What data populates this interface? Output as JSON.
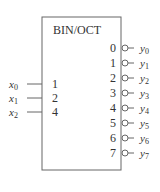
{
  "diagram": {
    "title": "BIN/OCT",
    "inputs": [
      {
        "var": "x",
        "sub": "0",
        "weight": "1"
      },
      {
        "var": "x",
        "sub": "1",
        "weight": "2"
      },
      {
        "var": "x",
        "sub": "2",
        "weight": "4"
      }
    ],
    "outputs": [
      {
        "index": "0",
        "var": "y",
        "sub": "0"
      },
      {
        "index": "1",
        "var": "y",
        "sub": "1"
      },
      {
        "index": "2",
        "var": "y",
        "sub": "2"
      },
      {
        "index": "3",
        "var": "y",
        "sub": "3"
      },
      {
        "index": "4",
        "var": "y",
        "sub": "4"
      },
      {
        "index": "5",
        "var": "y",
        "sub": "5"
      },
      {
        "index": "6",
        "var": "y",
        "sub": "6"
      },
      {
        "index": "7",
        "var": "y",
        "sub": "7"
      }
    ],
    "colors": {
      "stroke": "#555555",
      "text": "#333333"
    }
  }
}
